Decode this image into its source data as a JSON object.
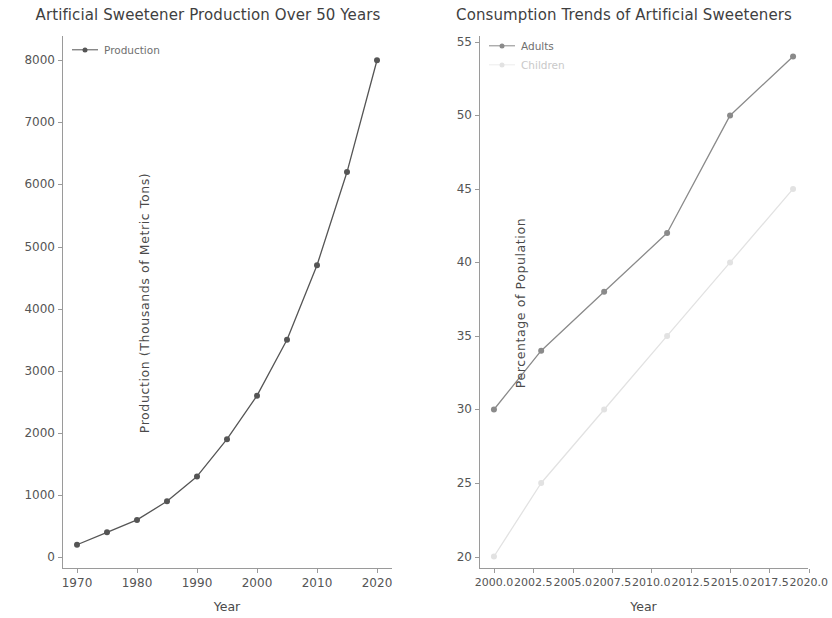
{
  "figure": {
    "width": 832,
    "height": 618,
    "background": "#ffffff"
  },
  "panels": [
    {
      "id": "left",
      "title": "Artificial Sweetener Production Over 50 Years",
      "xlabel": "Year",
      "ylabel": "Production (Thousands of Metric Tons)",
      "legend": [
        {
          "label": "Production",
          "color": "#555555",
          "marker": "circle"
        }
      ]
    },
    {
      "id": "right",
      "title": "Consumption Trends of Artificial Sweeteners",
      "xlabel": "Year",
      "ylabel": "Percentage of Population",
      "legend": [
        {
          "label": "Adults",
          "color": "#8a8a8a",
          "marker": "circle"
        },
        {
          "label": "Children",
          "color": "#e2e2e2",
          "marker": "circle"
        }
      ]
    }
  ],
  "chart_data": [
    {
      "type": "line",
      "title": "Artificial Sweetener Production Over 50 Years",
      "xlabel": "Year",
      "ylabel": "Production (Thousands of Metric Tons)",
      "x": [
        1970,
        1975,
        1980,
        1985,
        1990,
        1995,
        2000,
        2005,
        2010,
        2015,
        2020
      ],
      "series": [
        {
          "name": "Production",
          "color": "#555555",
          "values": [
            200,
            400,
            600,
            900,
            1300,
            1900,
            2600,
            3500,
            4700,
            6200,
            8000
          ]
        }
      ],
      "xlim": [
        1967.5,
        2022.5
      ],
      "ylim": [
        -190,
        8390
      ],
      "xticks": [
        1970,
        1980,
        1990,
        2000,
        2010,
        2020
      ],
      "xticklabels": [
        "1970",
        "1980",
        "1990",
        "2000",
        "2010",
        "2020"
      ],
      "yticks": [
        0,
        1000,
        2000,
        3000,
        4000,
        5000,
        6000,
        7000,
        8000
      ],
      "yticklabels": [
        "0",
        "1000",
        "2000",
        "3000",
        "4000",
        "5000",
        "6000",
        "7000",
        "8000"
      ],
      "grid": false,
      "legend_position": "upper left"
    },
    {
      "type": "line",
      "title": "Consumption Trends of Artificial Sweeteners",
      "xlabel": "Year",
      "ylabel": "Percentage of Population",
      "x": [
        2000,
        2003,
        2007,
        2011,
        2015,
        2019
      ],
      "series": [
        {
          "name": "Adults",
          "color": "#8a8a8a",
          "values": [
            30,
            34,
            38,
            42,
            50,
            54
          ]
        },
        {
          "name": "Children",
          "color": "#e2e2e2",
          "values": [
            20,
            25,
            30,
            35,
            40,
            45
          ]
        }
      ],
      "xlim": [
        1999.05,
        2019.95
      ],
      "ylim": [
        19.15,
        55.4
      ],
      "xticks": [
        2000.0,
        2002.5,
        2005.0,
        2007.5,
        2010.0,
        2012.5,
        2015.0,
        2017.5,
        2020.0
      ],
      "xticklabels": [
        "2000.0",
        "2002.5",
        "2005.0",
        "2007.5",
        "2010.0",
        "2012.5",
        "2015.0",
        "2017.5",
        "2020.0"
      ],
      "yticks": [
        20,
        25,
        30,
        35,
        40,
        45,
        50,
        55
      ],
      "yticklabels": [
        "20",
        "25",
        "30",
        "35",
        "40",
        "45",
        "50",
        "55"
      ],
      "grid": false,
      "legend_position": "upper left"
    }
  ]
}
